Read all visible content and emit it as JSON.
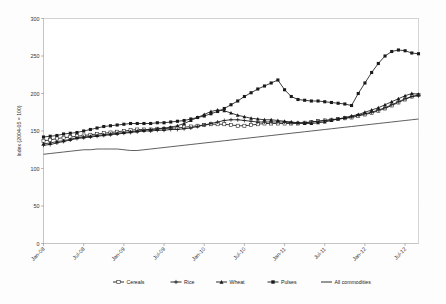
{
  "chart_data": {
    "type": "line",
    "title": "",
    "xlabel": "",
    "ylabel": "Index (2004-05 = 100)",
    "ylim": [
      0,
      300
    ],
    "yticks": [
      0,
      50,
      100,
      150,
      200,
      250,
      300
    ],
    "grid": true,
    "legend_position": "bottom",
    "x_tick_labels": [
      "Jan-08",
      "Jul-08",
      "Jan-09",
      "Jul-09",
      "Jan-10",
      "Jul-10",
      "Jan-11",
      "Jul-11",
      "Jan-12",
      "Jul-12"
    ],
    "x_tick_indices": [
      0,
      6,
      12,
      18,
      24,
      30,
      36,
      42,
      48,
      54
    ],
    "x": [
      "Jan-08",
      "Feb-08",
      "Mar-08",
      "Apr-08",
      "May-08",
      "Jun-08",
      "Jul-08",
      "Aug-08",
      "Sep-08",
      "Oct-08",
      "Nov-08",
      "Dec-08",
      "Jan-09",
      "Feb-09",
      "Mar-09",
      "Apr-09",
      "May-09",
      "Jun-09",
      "Jul-09",
      "Aug-09",
      "Sep-09",
      "Oct-09",
      "Nov-09",
      "Dec-09",
      "Jan-10",
      "Feb-10",
      "Mar-10",
      "Apr-10",
      "May-10",
      "Jun-10",
      "Jul-10",
      "Aug-10",
      "Sep-10",
      "Oct-10",
      "Nov-10",
      "Dec-10",
      "Jan-11",
      "Feb-11",
      "Mar-11",
      "Apr-11",
      "May-11",
      "Jun-11",
      "Jul-11",
      "Aug-11",
      "Sep-11",
      "Oct-11",
      "Nov-11",
      "Dec-11",
      "Jan-12",
      "Feb-12",
      "Mar-12",
      "Apr-12",
      "May-12",
      "Jun-12",
      "Jul-12",
      "Aug-12",
      "Sep-12"
    ],
    "series": [
      {
        "name": "Cereals",
        "marker": "square-open",
        "values": [
          137,
          138,
          140,
          141,
          142,
          143,
          144,
          145,
          146,
          147,
          148,
          149,
          150,
          151,
          152,
          152,
          152,
          153,
          153,
          154,
          154,
          155,
          156,
          157,
          158,
          159,
          159,
          159,
          158,
          157,
          157,
          158,
          159,
          160,
          160,
          160,
          160,
          160,
          160,
          161,
          162,
          163,
          164,
          165,
          166,
          167,
          168,
          170,
          172,
          174,
          177,
          180,
          184,
          188,
          192,
          196,
          198
        ]
      },
      {
        "name": "Rice",
        "marker": "plus",
        "values": [
          131,
          132,
          134,
          136,
          138,
          140,
          141,
          142,
          143,
          144,
          145,
          146,
          147,
          148,
          149,
          150,
          150,
          151,
          151,
          152,
          152,
          153,
          154,
          156,
          158,
          160,
          162,
          164,
          165,
          165,
          164,
          163,
          162,
          162,
          162,
          162,
          162,
          161,
          161,
          161,
          162,
          163,
          164,
          165,
          166,
          167,
          169,
          171,
          173,
          175,
          178,
          181,
          185,
          189,
          193,
          196,
          197
        ]
      },
      {
        "name": "Wheat",
        "marker": "triangle",
        "values": [
          133,
          134,
          136,
          137,
          139,
          141,
          142,
          143,
          144,
          145,
          146,
          147,
          148,
          149,
          150,
          151,
          152,
          153,
          154,
          155,
          157,
          160,
          164,
          168,
          172,
          176,
          178,
          177,
          174,
          171,
          169,
          167,
          166,
          165,
          165,
          164,
          163,
          162,
          161,
          160,
          160,
          161,
          162,
          164,
          166,
          168,
          170,
          172,
          175,
          178,
          181,
          185,
          189,
          193,
          197,
          200,
          199
        ]
      },
      {
        "name": "Pulses",
        "marker": "square-filled",
        "values": [
          142,
          143,
          144,
          146,
          147,
          148,
          150,
          152,
          154,
          156,
          157,
          158,
          159,
          160,
          160,
          160,
          160,
          161,
          161,
          162,
          163,
          164,
          166,
          168,
          170,
          173,
          176,
          180,
          185,
          190,
          196,
          201,
          206,
          210,
          214,
          218,
          205,
          196,
          192,
          191,
          190,
          190,
          189,
          188,
          187,
          186,
          184,
          182,
          181,
          180,
          178,
          176,
          174,
          176,
          180,
          186,
          192
        ]
      },
      {
        "name": "All commodities",
        "marker": "none",
        "values": [
          119,
          120,
          121,
          122,
          123,
          124,
          125,
          125,
          126,
          126,
          126,
          126,
          125,
          124,
          124,
          125,
          126,
          127,
          128,
          129,
          130,
          131,
          132,
          133,
          134,
          135,
          136,
          137,
          138,
          139,
          140,
          141,
          142,
          143,
          144,
          145,
          146,
          147,
          148,
          149,
          150,
          151,
          152,
          153,
          154,
          155,
          156,
          157,
          158,
          159,
          160,
          161,
          162,
          163,
          164,
          165,
          166
        ]
      }
    ],
    "pulses_tail": {
      "note": "Pulses rises sharply at right end",
      "values": [
        200,
        214,
        228,
        240,
        250,
        256,
        258,
        257,
        254,
        253
      ]
    }
  },
  "legend": {
    "items": [
      {
        "label": "Cereals",
        "marker": "square-open"
      },
      {
        "label": "Rice",
        "marker": "plus"
      },
      {
        "label": "Wheat",
        "marker": "triangle"
      },
      {
        "label": "Pulses",
        "marker": "square-filled"
      },
      {
        "label": "All commodities",
        "marker": "none"
      }
    ]
  }
}
